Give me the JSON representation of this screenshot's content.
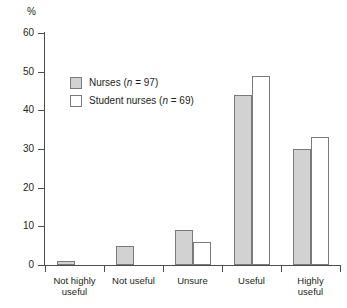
{
  "chart_data": {
    "type": "bar",
    "title": "",
    "xlabel": "",
    "ylabel": "%",
    "ylim": [
      0,
      60
    ],
    "yticks": [
      0,
      10,
      20,
      30,
      40,
      50,
      60
    ],
    "grid": false,
    "legend_position": "upper-left-inside",
    "categories": [
      "Not highly useful",
      "Not useful",
      "Unsure",
      "Useful",
      "Highly useful"
    ],
    "category_lines": [
      [
        "Not highly",
        "useful"
      ],
      [
        "Not useful",
        ""
      ],
      [
        "Unsure",
        ""
      ],
      [
        "Useful",
        ""
      ],
      [
        "Highly",
        "useful"
      ]
    ],
    "series": [
      {
        "name": "Nurses (n = 97)",
        "legend_prefix": "Nurses (",
        "legend_italic": "n",
        "legend_suffix": " = 97)",
        "color": "#d2d2d2",
        "values": [
          1,
          5,
          9,
          44,
          30
        ]
      },
      {
        "name": "Student nurses (n = 69)",
        "legend_prefix": "Student nurses (",
        "legend_italic": "n",
        "legend_suffix": " = 69)",
        "color": "#ffffff",
        "values": [
          0,
          0,
          6,
          49,
          33
        ]
      }
    ]
  },
  "axis": {
    "unit_label": "%"
  }
}
